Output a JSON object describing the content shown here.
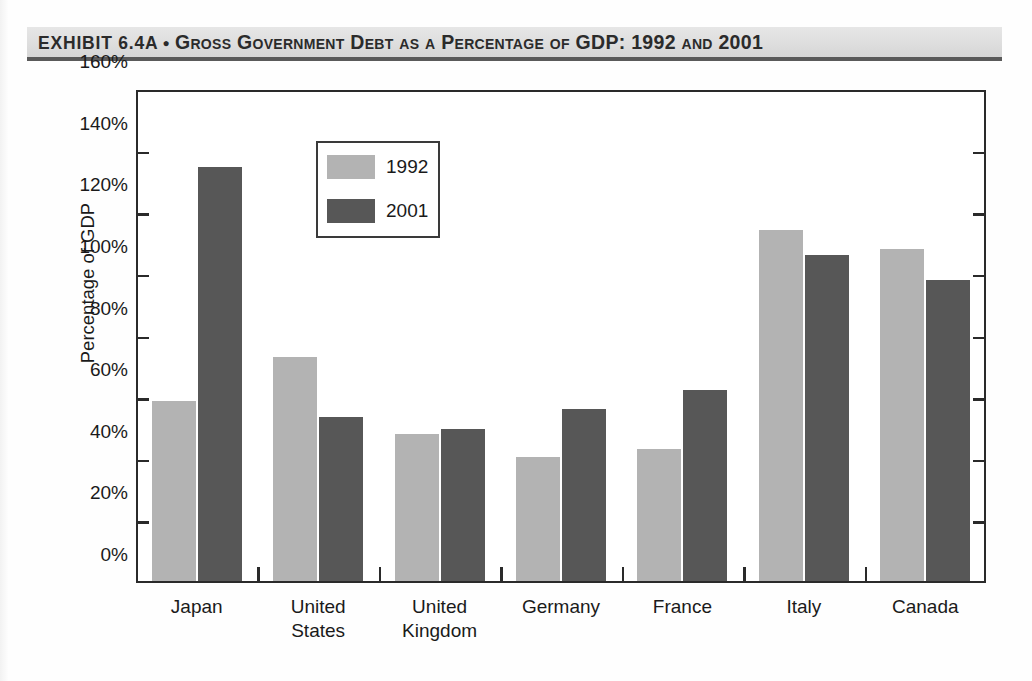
{
  "exhibit": {
    "label": "EXHIBIT 6.4A",
    "bullet": "●",
    "title": "Gross Government Debt as a Percentage of GDP: 1992 and 2001"
  },
  "chart_data": {
    "type": "bar",
    "title": "Gross Government Debt as a Percentage of GDP: 1992 and 2001",
    "xlabel": "",
    "ylabel": "Percentage of GDP",
    "ylim": [
      0,
      160
    ],
    "ytick_step": 20,
    "ytick_labels": [
      "0%",
      "20%",
      "40%",
      "60%",
      "80%",
      "100%",
      "120%",
      "140%",
      "160%"
    ],
    "ytick_values": [
      0,
      20,
      40,
      60,
      80,
      100,
      120,
      140,
      160
    ],
    "grid": false,
    "legend_position": "upper-left-inside",
    "categories": [
      "Japan",
      "United States",
      "United Kingdom",
      "Germany",
      "France",
      "Italy",
      "Canada"
    ],
    "category_lines": [
      [
        "Japan"
      ],
      [
        "United",
        "States"
      ],
      [
        "United",
        "Kingdom"
      ],
      [
        "Germany"
      ],
      [
        "France"
      ],
      [
        "Italy"
      ],
      [
        "Canada"
      ]
    ],
    "series": [
      {
        "name": "1992",
        "color": "#b3b3b3",
        "values": [
          59.0,
          73.5,
          48.5,
          41.0,
          43.5,
          114.5,
          108.5
        ]
      },
      {
        "name": "2001",
        "color": "#575757",
        "values": [
          135.0,
          54.0,
          50.0,
          56.5,
          62.5,
          106.5,
          98.5
        ]
      }
    ]
  },
  "colors": {
    "series_1992": "#b3b3b3",
    "series_2001": "#575757",
    "axis": "#2a2a2a",
    "title_band": "#e0e0e0"
  }
}
